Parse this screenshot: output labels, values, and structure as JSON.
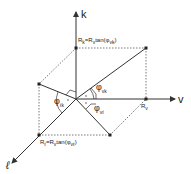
{
  "diagram": {
    "axes": {
      "k": "k",
      "v": "v",
      "l": "ℓ"
    },
    "labels": {
      "rk": "R",
      "rk_sub": "k",
      "rk_rhs": "=R",
      "rk_rhs_sub": "v",
      "rk_func": "tan(φ",
      "rk_func_sub": "vk",
      "rk_close": ")",
      "rl": "R",
      "rl_sub": "ℓ",
      "rl_rhs": "=R",
      "rl_rhs_sub": "v",
      "rl_func": "tan(φ",
      "rl_func_sub": "vℓ",
      "rl_close": ")",
      "rv": "R",
      "rv_sub": "v",
      "phi_vk": "φ",
      "phi_vk_sub": "vk",
      "phi_vl": "φ",
      "phi_vl_sub": "vℓ",
      "phi_lk": "φ",
      "phi_lk_sub": "ℓk"
    },
    "colors": {
      "line": "#333333",
      "dotted": "#555555"
    }
  }
}
